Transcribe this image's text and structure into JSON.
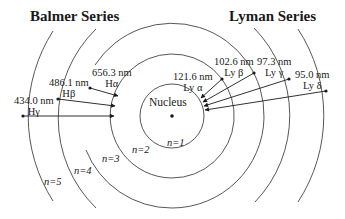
{
  "titles": {
    "left": "Balmer Series",
    "right": "Lyman Series"
  },
  "nucleus_label": "Nucleus",
  "levels": [
    {
      "n": 1,
      "label": "n=1",
      "radius": 32
    },
    {
      "n": 2,
      "label": "n=2",
      "radius": 62
    },
    {
      "n": 3,
      "label": "n=3",
      "radius": 92
    },
    {
      "n": 4,
      "label": "n=4",
      "radius": 125
    },
    {
      "n": 5,
      "label": "n=5",
      "radius": 158
    }
  ],
  "balmer": [
    {
      "wavelength": "656.3 nm",
      "name": "Hα",
      "from": 3,
      "to": 2
    },
    {
      "wavelength": "486.1 nm",
      "name": "Hβ",
      "from": 4,
      "to": 2
    },
    {
      "wavelength": "434.0 nm",
      "name": "Hγ",
      "from": 5,
      "to": 2
    }
  ],
  "lyman": [
    {
      "wavelength": "121.6 nm",
      "name": "Ly α",
      "from": 2,
      "to": 1
    },
    {
      "wavelength": "102.6 nm",
      "name": "Ly β",
      "from": 3,
      "to": 1
    },
    {
      "wavelength": "97.3 nm",
      "name": "Ly γ",
      "from": 4,
      "to": 1
    },
    {
      "wavelength": "95.0 nm",
      "name": "Ly δ",
      "from": 5,
      "to": 1
    }
  ]
}
